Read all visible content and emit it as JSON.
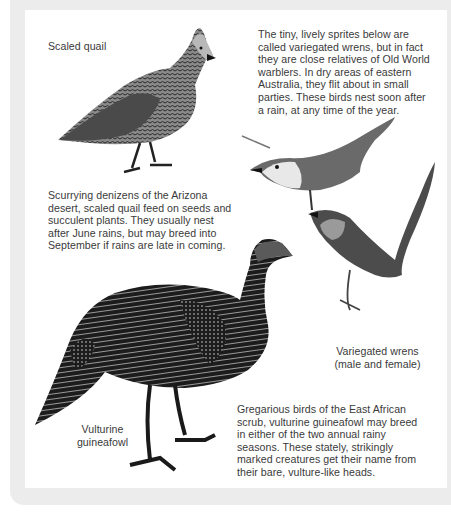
{
  "page": {
    "background": "#ffffff",
    "frame_color": "#ececec",
    "text_color": "#3a3a3a"
  },
  "captions": {
    "scaled_quail": "Scaled quail",
    "variegated_wrens": "Variegated wrens\n(male and female)",
    "vulturine_guineafowl": "Vulturine\nguineafowl"
  },
  "paragraphs": {
    "wrens": "The tiny, lively sprites below are\ncalled variegated wrens, but in fact\nthey are close relatives of Old World\nwarblers. In dry areas of eastern\nAustralia, they flit about in small\nparties. These birds nest soon after\na rain, at any time of the year.",
    "quail": "Scurrying denizens of the Arizona\ndesert, scaled quail feed on seeds and\nsucculent plants. They usually nest\nafter June rains, but may breed into\nSeptember if rains are late in coming.",
    "guineafowl": "Gregarious birds of the East African\nscrub, vulturine guineafowl may breed\nin either of the two annual rainy\nseasons. These stately, strikingly\nmarked creatures get their name from\ntheir bare, vulture-like heads."
  },
  "illustrations": [
    {
      "name": "scaled-quail",
      "label": "Scaled quail illustration"
    },
    {
      "name": "variegated-wren-female",
      "label": "Variegated wren (female) illustration"
    },
    {
      "name": "variegated-wren-male",
      "label": "Variegated wren (male) illustration"
    },
    {
      "name": "vulturine-guineafowl",
      "label": "Vulturine guineafowl illustration"
    }
  ]
}
